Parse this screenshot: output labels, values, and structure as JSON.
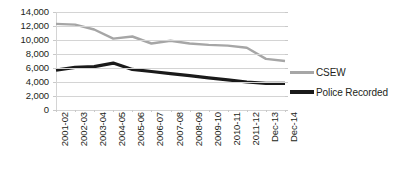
{
  "chart_data": {
    "type": "line",
    "title": "",
    "xlabel": "",
    "ylabel": "",
    "ylim": [
      0,
      14000
    ],
    "ytick_step": 2000,
    "grid": true,
    "legend_position": "right",
    "categories": [
      "2001-02",
      "2002-03",
      "2003-04",
      "2004-05",
      "2005-06",
      "2006-07",
      "2007-08",
      "2008-09",
      "2009-10",
      "2010-11",
      "2011-12",
      "Dec-13",
      "Dec-14"
    ],
    "ytick_labels": [
      "14,000",
      "12,000",
      "10,000",
      "8,000",
      "6,000",
      "4,000",
      "2,000",
      "0"
    ],
    "ytick_values": [
      14000,
      12000,
      10000,
      8000,
      6000,
      4000,
      2000,
      0
    ],
    "series": [
      {
        "name": "CSEW",
        "color": "#a6a6a6",
        "width": 2.4,
        "values": [
          12300,
          12200,
          11500,
          10200,
          10500,
          9500,
          9900,
          9500,
          9300,
          9200,
          8900,
          7300,
          7000
        ]
      },
      {
        "name": "Police Recorded",
        "color": "#1a1a1a",
        "width": 3.2,
        "values": [
          5700,
          6100,
          6200,
          6700,
          5800,
          5500,
          5200,
          4900,
          4600,
          4300,
          4000,
          3800,
          3800
        ]
      }
    ]
  },
  "legend": {
    "items": [
      {
        "label": "CSEW",
        "color": "#a6a6a6"
      },
      {
        "label": "Police Recorded",
        "color": "#1a1a1a"
      }
    ]
  }
}
